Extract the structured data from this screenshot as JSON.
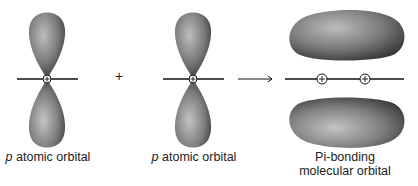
{
  "diagram": {
    "left_orbital": {
      "label_italic": "p",
      "label_rest": " atomic orbital"
    },
    "operator_plus": "+",
    "middle_orbital": {
      "label_italic": "p",
      "label_rest": " atomic orbital"
    },
    "arrow": "→",
    "result_orbital": {
      "label_line1": "Pi-bonding",
      "label_line2": "molecular orbital"
    },
    "nucleus_symbol": "+",
    "colors": {
      "lobe_dark": "#3a3a3a",
      "lobe_mid": "#8a8a8a",
      "lobe_light": "#c8c8c8",
      "line": "#111111"
    }
  }
}
